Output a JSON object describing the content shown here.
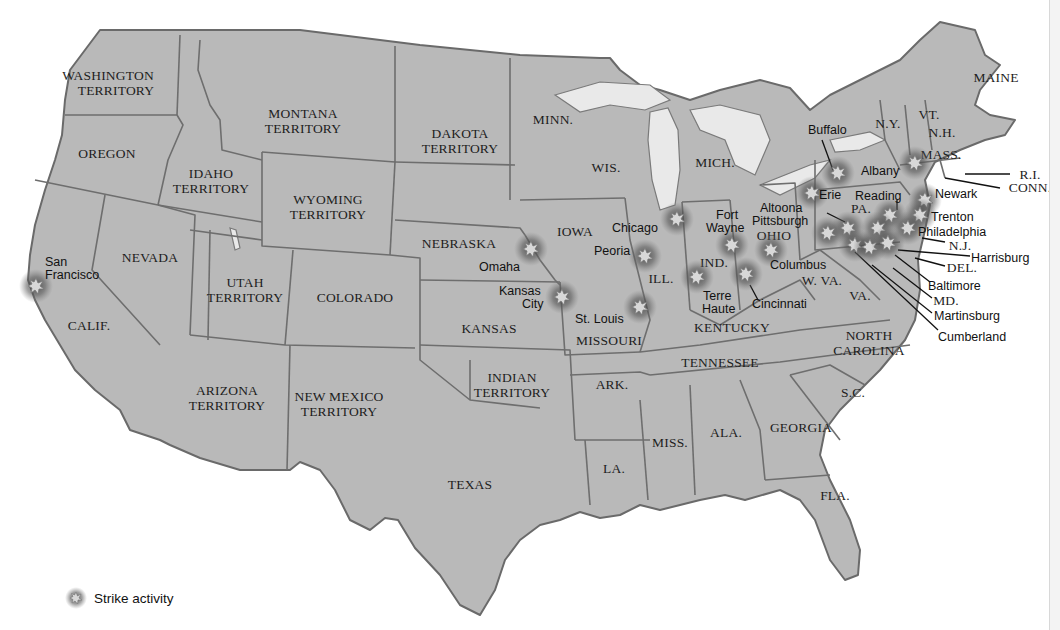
{
  "map": {
    "title": "Strike activity map (United States, 1877)",
    "colors": {
      "land": "#b9b9b9",
      "border": "#6e6e6e",
      "water": "#ffffff",
      "lake": "#e9e9e9",
      "strike_glow": "#555555"
    },
    "states": [
      {
        "id": "wa",
        "label": "WASHINGTON\nTERRITORY"
      },
      {
        "id": "or",
        "label": "OREGON"
      },
      {
        "id": "id",
        "label": "IDAHO\nTERRITORY"
      },
      {
        "id": "mt",
        "label": "MONTANA\nTERRITORY"
      },
      {
        "id": "wy",
        "label": "WYOMING\nTERRITORY"
      },
      {
        "id": "dk",
        "label": "DAKOTA\nTERRITORY"
      },
      {
        "id": "mn",
        "label": "MINN."
      },
      {
        "id": "wi",
        "label": "WIS."
      },
      {
        "id": "mi",
        "label": "MICH."
      },
      {
        "id": "ca",
        "label": "CALIF."
      },
      {
        "id": "nv",
        "label": "NEVADA"
      },
      {
        "id": "ut",
        "label": "UTAH\nTERRITORY"
      },
      {
        "id": "co",
        "label": "COLORADO"
      },
      {
        "id": "ne",
        "label": "NEBRASKA"
      },
      {
        "id": "ia",
        "label": "IOWA"
      },
      {
        "id": "ks",
        "label": "KANSAS"
      },
      {
        "id": "mo",
        "label": "MISSOURI"
      },
      {
        "id": "il",
        "label": "ILL."
      },
      {
        "id": "in",
        "label": "IND."
      },
      {
        "id": "oh",
        "label": "OHIO"
      },
      {
        "id": "ky",
        "label": "KENTUCKY"
      },
      {
        "id": "wv",
        "label": "W. VA."
      },
      {
        "id": "va",
        "label": "VA."
      },
      {
        "id": "pa",
        "label": "PA."
      },
      {
        "id": "ny",
        "label": "N.Y."
      },
      {
        "id": "vt",
        "label": "VT."
      },
      {
        "id": "nh",
        "label": "N.H."
      },
      {
        "id": "me",
        "label": "MAINE"
      },
      {
        "id": "ma",
        "label": "MASS."
      },
      {
        "id": "ri",
        "label": "R.I."
      },
      {
        "id": "ct",
        "label": "CONN."
      },
      {
        "id": "nj",
        "label": "N.J."
      },
      {
        "id": "de",
        "label": "DEL."
      },
      {
        "id": "md",
        "label": "MD."
      },
      {
        "id": "az",
        "label": "ARIZONA\nTERRITORY"
      },
      {
        "id": "nm",
        "label": "NEW MEXICO\nTERRITORY"
      },
      {
        "id": "it",
        "label": "INDIAN\nTERRITORY"
      },
      {
        "id": "tx",
        "label": "TEXAS"
      },
      {
        "id": "ar",
        "label": "ARK."
      },
      {
        "id": "la",
        "label": "LA."
      },
      {
        "id": "ms",
        "label": "MISS."
      },
      {
        "id": "al",
        "label": "ALA."
      },
      {
        "id": "tn",
        "label": "TENNESSEE"
      },
      {
        "id": "ga",
        "label": "GEORGIA"
      },
      {
        "id": "sc",
        "label": "S.C."
      },
      {
        "id": "nc",
        "label": "NORTH\nCAROLINA"
      },
      {
        "id": "fl",
        "label": "FLA."
      }
    ],
    "cities": [
      {
        "name": "San\nFrancisco",
        "strike": true
      },
      {
        "name": "Omaha",
        "strike": true
      },
      {
        "name": "Kansas\nCity",
        "strike": true
      },
      {
        "name": "St. Louis",
        "strike": true
      },
      {
        "name": "Chicago",
        "strike": true
      },
      {
        "name": "Peoria",
        "strike": true
      },
      {
        "name": "Fort\nWayne",
        "strike": true
      },
      {
        "name": "Terre\nHaute",
        "strike": true
      },
      {
        "name": "Cincinnati",
        "strike": true
      },
      {
        "name": "Columbus",
        "strike": true
      },
      {
        "name": "Altoona",
        "strike": true
      },
      {
        "name": "Pittsburgh",
        "strike": true
      },
      {
        "name": "Buffalo",
        "strike": true
      },
      {
        "name": "Erie",
        "strike": true
      },
      {
        "name": "Albany",
        "strike": true
      },
      {
        "name": "Reading",
        "strike": true
      },
      {
        "name": "Newark",
        "strike": true
      },
      {
        "name": "Trenton",
        "strike": true
      },
      {
        "name": "Philadelphia",
        "strike": true
      },
      {
        "name": "Harrisburg",
        "strike": true
      },
      {
        "name": "Baltimore",
        "strike": true
      },
      {
        "name": "Martinsburg",
        "strike": true
      },
      {
        "name": "Cumberland",
        "strike": true
      }
    ]
  },
  "legend": {
    "icon": "strike-burst-icon",
    "label": "Strike activity"
  }
}
